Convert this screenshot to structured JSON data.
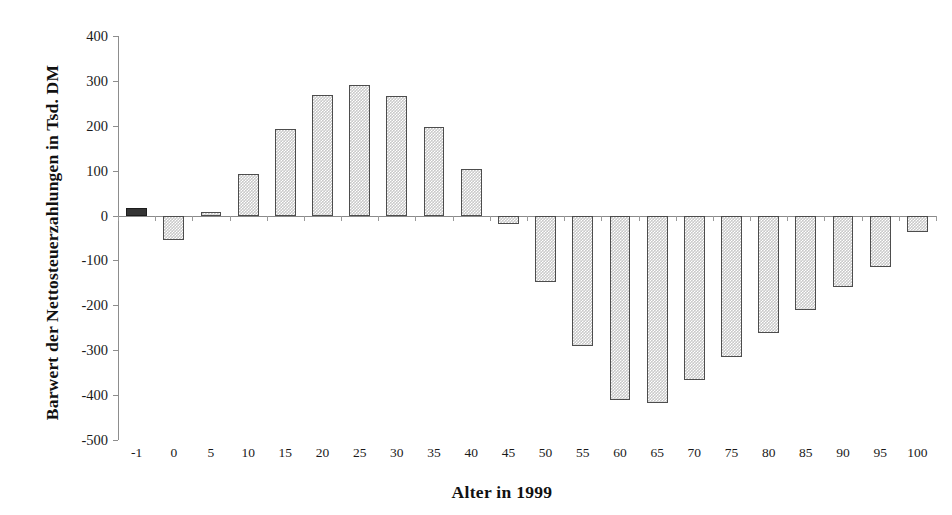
{
  "chart_data": {
    "type": "bar",
    "title": "",
    "xlabel": "Alter in 1999",
    "ylabel": "Barwert der Nettosteuerzahlungen in Tsd. DM",
    "categories": [
      "-1",
      "0",
      "5",
      "10",
      "15",
      "20",
      "25",
      "30",
      "35",
      "40",
      "45",
      "50",
      "55",
      "60",
      "65",
      "70",
      "75",
      "80",
      "85",
      "90",
      "95",
      "100"
    ],
    "values": [
      17,
      -55,
      7,
      92,
      192,
      269,
      291,
      266,
      197,
      103,
      -18,
      -148,
      -290,
      -412,
      -418,
      -366,
      -315,
      -262,
      -211,
      -160,
      -114,
      -36
    ],
    "highlight_index": 0,
    "highlight_color": "#343434",
    "bar_color": "#c9c9c9",
    "bar_border_color": "#4d4d4d",
    "ylim": [
      -500,
      400
    ],
    "yticks": [
      400,
      300,
      200,
      100,
      0,
      -100,
      -200,
      -300,
      -400,
      -500
    ],
    "ytick_labels": [
      "400",
      "300",
      "200",
      "100",
      "0",
      "-100",
      "-200",
      "-300",
      "-400",
      "-500"
    ],
    "grid": false,
    "legend": "none"
  },
  "axes": {
    "y_title": "Barwert der Nettosteuerzahlungen in Tsd. DM",
    "x_title": "Alter in 1999"
  }
}
